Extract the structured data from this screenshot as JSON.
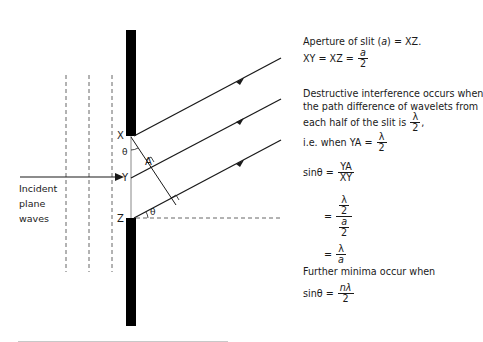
{
  "diagram": {
    "type": "single-slit diffraction",
    "labels": {
      "point_x": "X",
      "point_y": "Y",
      "point_z": "Z",
      "point_a": "A",
      "angle_top": "θ",
      "angle_bottom": "θ",
      "incident_line1": "Incident",
      "incident_line2": "plane",
      "incident_line3": "waves"
    },
    "colors": {
      "ink": "#1a1a1a",
      "barrier": "#000000",
      "dashed": "#555555",
      "background": "#ffffff"
    }
  },
  "explanation": {
    "line1": "Aperture of slit (",
    "line1_var": "a",
    "line1_end": ") = XZ.",
    "line2_prefix": "XY = XZ =",
    "line2_num": "a",
    "line2_den": "2",
    "para2_line1": "Destructive interference occurs when",
    "para2_line2": "the path difference of wavelets from",
    "para2_line3": "each half of the slit is",
    "para2_line3_num": "λ",
    "para2_line3_den": "2",
    "para2_line3_end": ",",
    "para2_line4": "i.e. when YA =",
    "para2_line4_num": "λ",
    "para2_line4_den": "2",
    "eq1_lhs": "sinθ =",
    "eq1_num": "YA",
    "eq1_den": "XY",
    "eq2_eq": "=",
    "eq2_num_num": "λ",
    "eq2_num_den": "2",
    "eq2_den_num": "a",
    "eq2_den_den": "2",
    "eq3_eq": "=",
    "eq3_num": "λ",
    "eq3_den": "a",
    "further": "Further minima occur when",
    "eq4_lhs": "sinθ =",
    "eq4_num": "nλ",
    "eq4_den": "2"
  }
}
